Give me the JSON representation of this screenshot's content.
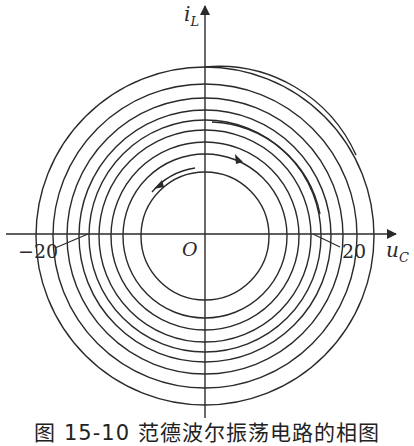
{
  "figure": {
    "caption": "图 15-10   范德波尔振荡电路的相图",
    "axes": {
      "x_label": "u",
      "x_label_sub": "C",
      "y_label": "i",
      "y_label_sub": "L",
      "origin_label": "O",
      "tick_left": "−20",
      "tick_right": "20"
    },
    "colors": {
      "stroke": "#2a2a2a",
      "background": "#ffffff"
    },
    "curve": {
      "type": "spiral phase trajectory converging to limit cycle",
      "center": [
        205,
        236
      ],
      "limit_cycle_radius": 64,
      "direction": "counterclockwise"
    }
  }
}
